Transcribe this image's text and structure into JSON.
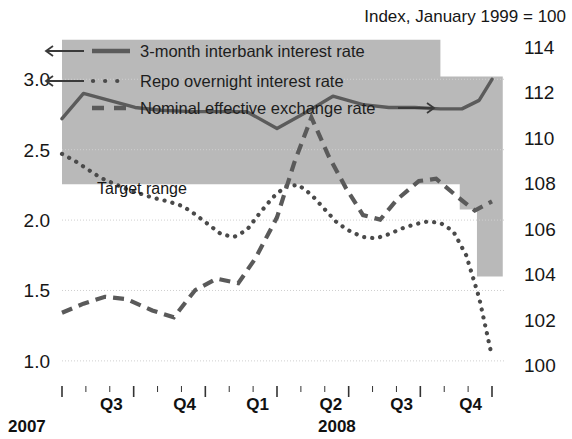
{
  "chart_data": {
    "type": "line",
    "title": "Index, January 1999 = 100",
    "xlabel": "",
    "ylabel_left": "",
    "ylabel_right": "Index, January 1999 = 100",
    "grid": true,
    "legend_position": "top-left",
    "left_axis": {
      "ticks": [
        "3.0",
        "2.5",
        "2.0",
        "1.5",
        "1.0"
      ],
      "values": [
        3.0,
        2.5,
        2.0,
        1.5,
        1.0
      ],
      "ylim": [
        0.85,
        3.35
      ]
    },
    "right_axis": {
      "ticks": [
        "114",
        "112",
        "110",
        "108",
        "106",
        "104",
        "102",
        "100"
      ],
      "values": [
        114,
        112,
        110,
        108,
        106,
        104,
        102,
        100
      ],
      "ylim": [
        99.25,
        114.75
      ]
    },
    "x_axis": {
      "quarter_labels": [
        "Q3",
        "Q4",
        "Q1",
        "Q2",
        "Q3",
        "Q4"
      ],
      "year_labels": [
        "2007",
        "2008"
      ],
      "range": "2007-Q3 to 2008-Q4"
    },
    "annotations": [
      {
        "text": "Target range",
        "x_frac": 0.22,
        "value_left": 2.33
      }
    ],
    "series": [
      {
        "name": "3-month interbank interest rate",
        "style": "solid",
        "axis": "left",
        "color": "#5b5b5b",
        "x": [
          0.0,
          0.05,
          0.11,
          0.17,
          0.23,
          0.3,
          0.37,
          0.43,
          0.5,
          0.57,
          0.63,
          0.7,
          0.76,
          0.82,
          0.88,
          0.93,
          0.97,
          1.0
        ],
        "values": [
          2.72,
          2.9,
          2.85,
          2.8,
          2.78,
          2.77,
          2.77,
          2.77,
          2.65,
          2.77,
          2.88,
          2.82,
          2.8,
          2.8,
          2.79,
          2.79,
          2.85,
          3.0
        ]
      },
      {
        "name": "Repo overnight interest rate",
        "style": "dotted",
        "axis": "left",
        "color": "#4a4a4a",
        "x": [
          0.0,
          0.03,
          0.06,
          0.09,
          0.12,
          0.15,
          0.18,
          0.21,
          0.25,
          0.28,
          0.31,
          0.34,
          0.37,
          0.4,
          0.43,
          0.46,
          0.49,
          0.52,
          0.55,
          0.58,
          0.61,
          0.64,
          0.67,
          0.7,
          0.73,
          0.76,
          0.79,
          0.82,
          0.85,
          0.88,
          0.91,
          0.94,
          0.97,
          1.0
        ],
        "values": [
          2.47,
          2.42,
          2.36,
          2.3,
          2.26,
          2.22,
          2.19,
          2.16,
          2.13,
          2.1,
          2.04,
          1.97,
          1.9,
          1.88,
          1.93,
          2.05,
          2.16,
          2.24,
          2.25,
          2.18,
          2.08,
          1.98,
          1.92,
          1.88,
          1.87,
          1.9,
          1.94,
          1.97,
          1.99,
          1.98,
          1.92,
          1.75,
          1.45,
          1.03
        ]
      },
      {
        "name": "Nominal effective exchange rate",
        "style": "dashed",
        "axis": "right",
        "color": "#5a5a5a",
        "x": [
          0.0,
          0.05,
          0.1,
          0.15,
          0.21,
          0.26,
          0.31,
          0.36,
          0.41,
          0.45,
          0.5,
          0.54,
          0.58,
          0.62,
          0.66,
          0.7,
          0.74,
          0.78,
          0.83,
          0.87,
          0.92,
          0.96,
          1.0
        ],
        "values": [
          102.3,
          102.7,
          103.0,
          102.9,
          102.4,
          102.1,
          103.3,
          103.8,
          103.6,
          104.7,
          106.5,
          108.9,
          110.9,
          109.2,
          107.8,
          106.6,
          106.4,
          107.3,
          108.1,
          108.2,
          107.4,
          106.8,
          107.2
        ]
      }
    ]
  },
  "header": {
    "index_note": "Index, January 1999 = 100"
  },
  "legend": {
    "items": [
      {
        "label": "3-month interbank interest rate",
        "arrow": "left",
        "style": "solid"
      },
      {
        "label": "Repo overnight interest rate",
        "arrow": "left",
        "style": "dotted"
      },
      {
        "label": "Nominal effective exchange rate",
        "arrow": "right",
        "style": "dashed"
      }
    ]
  },
  "band": {
    "label": "Target range",
    "color": "#b9b9b9"
  },
  "axis": {
    "left_ticks": [
      "3.0",
      "2.5",
      "2.0",
      "1.5",
      "1.0"
    ],
    "right_ticks": [
      "114",
      "112",
      "110",
      "108",
      "106",
      "104",
      "102",
      "100"
    ],
    "quarters": [
      "Q3",
      "Q4",
      "Q1",
      "Q2",
      "Q3",
      "Q4"
    ],
    "years": [
      "2007",
      "2008"
    ]
  }
}
